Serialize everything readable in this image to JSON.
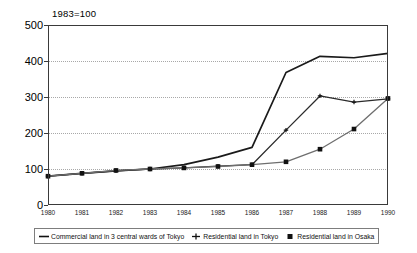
{
  "chart_data": {
    "type": "line",
    "title": "1983=100",
    "xlabel": "",
    "ylabel": "",
    "xlim": [
      1980,
      1990
    ],
    "ylim": [
      0,
      500
    ],
    "grid": true,
    "legend_position": "bottom",
    "x": [
      1980,
      1981,
      1982,
      1983,
      1984,
      1985,
      1986,
      1987,
      1988,
      1989,
      1990
    ],
    "categories": [
      "1980",
      "1981",
      "1982",
      "1983",
      "1984",
      "1985",
      "1986",
      "1987",
      "1988",
      "1989",
      "1990"
    ],
    "ytick_labels": [
      "0",
      "100",
      "200",
      "300",
      "400",
      "500"
    ],
    "ytick_values": [
      0,
      100,
      200,
      300,
      400,
      500
    ],
    "series": [
      {
        "name": "Commercial land in 3 central wards of Tokyo",
        "marker": "none",
        "color": "#1a1a1a",
        "values": [
          80,
          88,
          95,
          100,
          112,
          133,
          160,
          368,
          413,
          409,
          421
        ]
      },
      {
        "name": "Residential land in Tokyo",
        "marker": "plus",
        "color": "#2b2b2b",
        "values": [
          80,
          88,
          95,
          100,
          103,
          108,
          112,
          208,
          303,
          286,
          295
        ]
      },
      {
        "name": "Residential land in Osaka",
        "marker": "square",
        "color": "#6e6e6e",
        "values": [
          80,
          88,
          96,
          100,
          103,
          107,
          112,
          120,
          155,
          211,
          296
        ]
      }
    ]
  },
  "legend": {
    "items": [
      {
        "label": "Commercial land in 3 central wards of Tokyo",
        "marker": "line"
      },
      {
        "label": "Residential land in Tokyo",
        "marker": "plus"
      },
      {
        "label": "Residential land in Osaka",
        "marker": "square"
      }
    ]
  }
}
